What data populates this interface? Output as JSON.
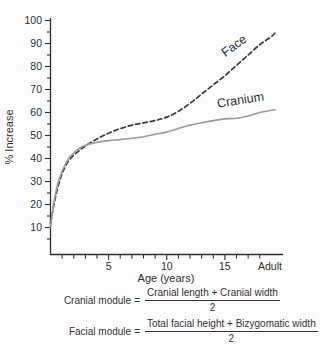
{
  "chart_data": {
    "type": "line",
    "title": "",
    "xlabel": "Age (years)",
    "ylabel": "% Increase",
    "xlim": [
      0,
      20
    ],
    "ylim": [
      0,
      100
    ],
    "grid": false,
    "legend": "inline-curve-labels",
    "y_axis": {
      "major_ticks": [
        10,
        20,
        30,
        40,
        50,
        60,
        70,
        80,
        90,
        100
      ],
      "minor_tick_step": 5
    },
    "x_axis": {
      "tick_years": [
        1,
        2,
        3,
        4,
        5,
        6,
        7,
        8,
        9,
        10,
        11,
        12,
        13,
        14,
        15,
        16,
        17,
        18
      ],
      "labeled_ticks": [
        5,
        10,
        15
      ],
      "end_label": "Adult"
    },
    "series": [
      {
        "name": "Face",
        "style": "dashed",
        "color": "#3a3a3a",
        "points": [
          [
            0,
            12
          ],
          [
            0.3,
            20
          ],
          [
            0.6,
            27
          ],
          [
            1,
            33.5
          ],
          [
            1.5,
            38.5
          ],
          [
            2,
            41.5
          ],
          [
            2.5,
            43.5
          ],
          [
            3,
            45.5
          ],
          [
            4,
            48.5
          ],
          [
            5,
            51
          ],
          [
            6,
            53
          ],
          [
            7,
            54.5
          ],
          [
            8,
            55.5
          ],
          [
            9,
            56.5
          ],
          [
            10,
            58
          ],
          [
            11,
            60.5
          ],
          [
            12,
            64
          ],
          [
            13,
            68
          ],
          [
            14,
            72
          ],
          [
            15,
            76
          ],
          [
            16,
            80.5
          ],
          [
            17,
            85
          ],
          [
            18,
            89.5
          ],
          [
            19,
            93
          ],
          [
            19.3,
            94.5
          ]
        ]
      },
      {
        "name": "Cranium",
        "style": "solid",
        "color": "#9b9b9b",
        "points": [
          [
            0,
            10
          ],
          [
            0.3,
            21
          ],
          [
            0.6,
            28.5
          ],
          [
            1,
            34.5
          ],
          [
            1.5,
            39.5
          ],
          [
            2,
            42.5
          ],
          [
            2.5,
            44.5
          ],
          [
            3,
            45.8
          ],
          [
            4,
            47
          ],
          [
            5,
            47.8
          ],
          [
            6,
            48.2
          ],
          [
            7,
            48.8
          ],
          [
            8,
            49.5
          ],
          [
            9,
            50.5
          ],
          [
            10,
            51.5
          ],
          [
            11,
            53
          ],
          [
            12,
            54.5
          ],
          [
            13,
            55.5
          ],
          [
            14,
            56.5
          ],
          [
            15,
            57.2
          ],
          [
            16,
            57.5
          ],
          [
            17,
            58.5
          ],
          [
            18,
            60
          ],
          [
            19,
            61
          ],
          [
            19.3,
            61.2
          ]
        ]
      }
    ]
  },
  "formulas": {
    "rows": [
      {
        "label": "Cranial module",
        "equals": "=",
        "numerator": "Cranial length + Cranial width",
        "denominator": "2"
      },
      {
        "label": "Facial module",
        "equals": "=",
        "numerator": "Total facial height + Bizygomatic width",
        "denominator": "2"
      }
    ]
  }
}
